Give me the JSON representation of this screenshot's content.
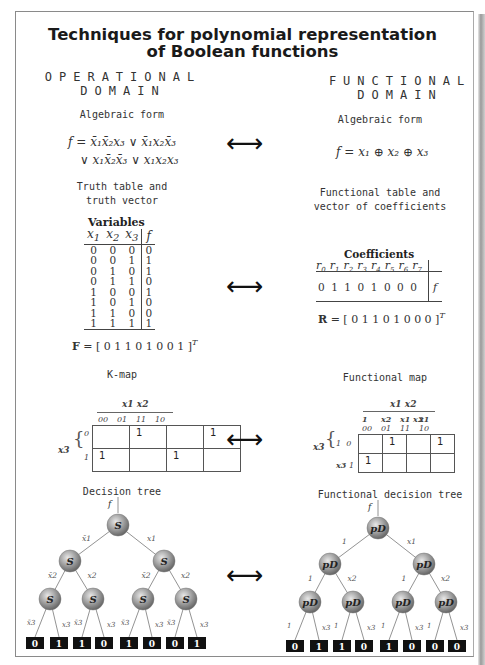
{
  "title_line1": "Techniques for polynomial representation",
  "title_line2": "of Boolean functions",
  "operational": {
    "domain_line1": "OPERATIONAL",
    "domain_line2": "DOMAIN",
    "algebraic_label": "Algebraic form",
    "algebraic_line1": "f = x̄₁x̄₂x₃ ∨ x̄₁x₂x̄₃",
    "algebraic_line2": "∨ x₁x̄₂x̄₃ ∨ x₁x₂x₃",
    "truth_label_line1": "Truth table and",
    "truth_label_line2": "truth vector",
    "truth_table": {
      "caption": "Variables",
      "headers": [
        "x1",
        "x2",
        "x3",
        "f"
      ],
      "rows": [
        [
          0,
          0,
          0,
          0
        ],
        [
          0,
          0,
          1,
          1
        ],
        [
          0,
          1,
          0,
          1
        ],
        [
          0,
          1,
          1,
          0
        ],
        [
          1,
          0,
          0,
          1
        ],
        [
          1,
          0,
          1,
          0
        ],
        [
          1,
          1,
          0,
          0
        ],
        [
          1,
          1,
          1,
          1
        ]
      ]
    },
    "vector_name": "F",
    "vector_value": "= [ 0 1 1 0 1 0 0 1 ]",
    "vector_sup": "T",
    "kmap_label": "K-map",
    "kmap": {
      "col_var": "x1 x2",
      "col_codes": [
        "00",
        "01",
        "11",
        "10"
      ],
      "row_var": "x3",
      "row_codes": [
        "0",
        "1"
      ],
      "cells": [
        [
          "",
          "1",
          "",
          "1"
        ],
        [
          "1",
          "",
          "1",
          ""
        ]
      ]
    },
    "tree_label": "Decision tree",
    "tree_node": "S",
    "tree_root_label": "f",
    "tree_edges_left": [
      "x̄1",
      "x̄2",
      "x̄3"
    ],
    "tree_edges_right": [
      "x1",
      "x2",
      "x3"
    ],
    "tree_leaves": [
      "0",
      "1",
      "1",
      "0",
      "1",
      "0",
      "0",
      "1"
    ]
  },
  "functional": {
    "domain_line1": "FUNCTIONAL",
    "domain_line2": "DOMAIN",
    "algebraic_label": "Algebraic form",
    "algebraic_line1": "f = x₁ ⊕ x₂ ⊕ x₃",
    "table_label_line1": "Functional table and",
    "table_label_line2": "vector of coefficients",
    "coef_table": {
      "caption": "Coefficients",
      "headers": [
        "r0",
        "r1",
        "r2",
        "r3",
        "r4",
        "r5",
        "r6",
        "r7"
      ],
      "values": [
        0,
        1,
        1,
        0,
        1,
        0,
        0,
        0
      ],
      "row_label": "f"
    },
    "vector_name": "R",
    "vector_value": "= [ 0 1 1 0 1 0 0 0 ]",
    "vector_sup": "T",
    "map_label": "Functional map",
    "fmap": {
      "col_var": "x1 x2",
      "col_terms": [
        "1",
        "x2",
        "x1 x2",
        "x1"
      ],
      "col_codes": [
        "00",
        "01",
        "11",
        "10"
      ],
      "row_var": "x3",
      "row_terms": [
        "1",
        "x3"
      ],
      "row_codes": [
        "0",
        "1"
      ],
      "cells": [
        [
          "",
          "1",
          "",
          "1"
        ],
        [
          "1",
          "",
          "",
          ""
        ]
      ]
    },
    "tree_label": "Functional decision tree",
    "tree_node": "pD",
    "tree_root_label": "f",
    "tree_edges_left": [
      "1",
      "1",
      "1"
    ],
    "tree_edges_right": [
      "x1",
      "x2",
      "x3"
    ],
    "tree_leaves": [
      "0",
      "1",
      "1",
      "0",
      "1",
      "0",
      "0",
      "0"
    ]
  },
  "arrows": [
    "⟷",
    "⟷",
    "⟷",
    "⟷"
  ]
}
